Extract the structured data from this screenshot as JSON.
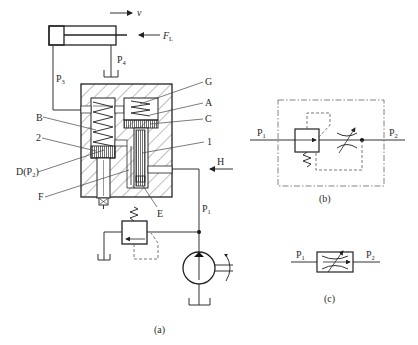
{
  "figure": {
    "subfigures": [
      {
        "id": "a",
        "caption": "(a)",
        "description": "Sectional structure of speed-regulating valve in hydraulic circuit"
      },
      {
        "id": "b",
        "caption": "(b)",
        "description": "Detailed graphical symbol"
      },
      {
        "id": "c",
        "caption": "(c)",
        "description": "Simplified graphical symbol"
      }
    ]
  },
  "fig_a": {
    "velocity_label": "v",
    "load_label": "F",
    "load_sub": "L",
    "ports": {
      "p3": {
        "main": "P",
        "sub": "3"
      },
      "p4": {
        "main": "P",
        "sub": "4"
      },
      "p1": {
        "main": "P",
        "sub": "1"
      }
    },
    "callouts_left": [
      {
        "text": "B"
      },
      {
        "text": "2"
      },
      {
        "text": "D(P",
        "sub": "2",
        "close": ")"
      },
      {
        "text": "F"
      }
    ],
    "callouts_right": [
      {
        "text": "G"
      },
      {
        "text": "A"
      },
      {
        "text": "C"
      },
      {
        "text": "1"
      },
      {
        "text": "H"
      }
    ],
    "callout_bottom": {
      "text": "E"
    },
    "caption": "(a)"
  },
  "fig_b": {
    "inlet": {
      "main": "P",
      "sub": "1"
    },
    "outlet": {
      "main": "P",
      "sub": "2"
    },
    "caption": "(b)"
  },
  "fig_c": {
    "inlet": {
      "main": "P",
      "sub": "1"
    },
    "outlet": {
      "main": "P",
      "sub": "2"
    },
    "caption": "(c)"
  }
}
